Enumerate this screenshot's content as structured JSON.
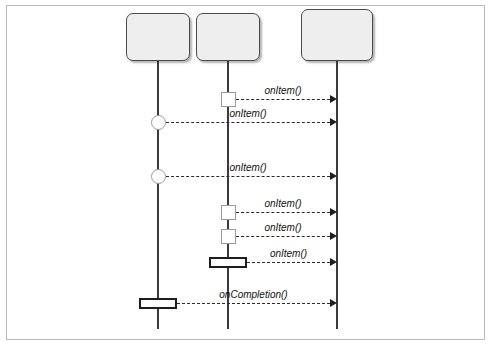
{
  "diagram": {
    "type": "uml-sequence-diagram",
    "border_color": "#b9b9b9",
    "background": "#ffffff",
    "lifelines": [
      {
        "id": "circles",
        "label_lines": [
          "Stream of",
          "circles"
        ],
        "x": 158,
        "box": {
          "left": 126,
          "top": 13,
          "width": 64,
          "height": 48
        },
        "line_top": 61,
        "line_bottom": 329,
        "fill": "#eeeeee",
        "stroke": "#4a4a4a"
      },
      {
        "id": "squares",
        "label_lines": [
          "Stream of",
          "squares"
        ],
        "x": 228,
        "box": {
          "left": 196,
          "top": 13,
          "width": 64,
          "height": 48
        },
        "line_top": 61,
        "line_bottom": 329,
        "fill": "#eeeeee",
        "stroke": "#4a4a4a"
      },
      {
        "id": "observer",
        "label_lines": [
          "Observer of",
          "circles and",
          "squares"
        ],
        "x": 337,
        "box": {
          "left": 301,
          "top": 9,
          "width": 72,
          "height": 52
        },
        "line_top": 61,
        "line_bottom": 329,
        "fill": "#eeeeee",
        "stroke": "#4a4a4a"
      }
    ],
    "events": [
      {
        "index": 0,
        "source": "squares",
        "target": "observer",
        "label": "onItem()",
        "y": 99,
        "marker": "square",
        "marker_color": "#9a9a9a"
      },
      {
        "index": 1,
        "source": "circles",
        "target": "observer",
        "label": "onItem()",
        "y": 122,
        "marker": "circle",
        "marker_color": "#9a9a9a"
      },
      {
        "index": 2,
        "source": "circles",
        "target": "observer",
        "label": "onItem()",
        "y": 176,
        "marker": "circle",
        "marker_color": "#9a9a9a"
      },
      {
        "index": 3,
        "source": "squares",
        "target": "observer",
        "label": "onItem()",
        "y": 212,
        "marker": "square",
        "marker_color": "#9a9a9a"
      },
      {
        "index": 4,
        "source": "squares",
        "target": "observer",
        "label": "onItem()",
        "y": 236,
        "marker": "square",
        "marker_color": "#9a9a9a"
      },
      {
        "index": 5,
        "source": "squares",
        "target": "observer",
        "label": "onItem()",
        "y": 262,
        "marker": "bar",
        "marker_color": "#1e1e1e"
      },
      {
        "index": 6,
        "source": "circles",
        "target": "observer",
        "label": "onCompletion()",
        "y": 303,
        "marker": "bar",
        "marker_color": "#1e1e1e"
      }
    ]
  }
}
